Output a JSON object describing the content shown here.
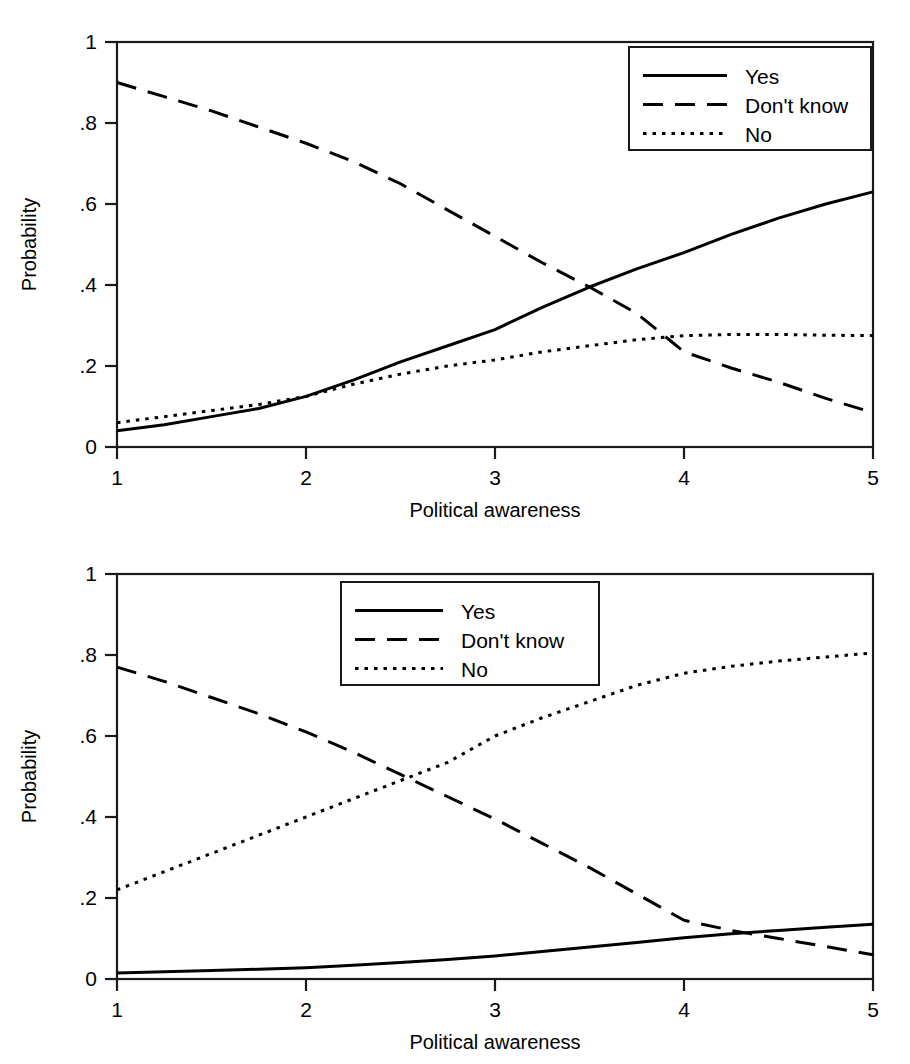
{
  "figure": {
    "background_color": "#ffffff",
    "line_color": "#000000",
    "panels": [
      "top",
      "bottom"
    ]
  },
  "panel_top": {
    "name": "top-panel",
    "xlabel": "Political awareness",
    "ylabel": "Probability",
    "xticks": [
      "1",
      "2",
      "3",
      "4",
      "5"
    ],
    "yticks": [
      "0",
      ".2",
      ".4",
      ".6",
      ".8",
      "1"
    ],
    "legend": {
      "position": "top-right",
      "items": [
        {
          "label": "Yes",
          "style": "solid"
        },
        {
          "label": "Don't know",
          "style": "dashed"
        },
        {
          "label": "No",
          "style": "dotted"
        }
      ]
    }
  },
  "panel_bottom": {
    "name": "bottom-panel",
    "xlabel": "Political awareness",
    "ylabel": "Probability",
    "xticks": [
      "1",
      "2",
      "3",
      "4",
      "5"
    ],
    "yticks": [
      "0",
      ".2",
      ".4",
      ".6",
      ".8",
      "1"
    ],
    "legend": {
      "position": "top-center",
      "items": [
        {
          "label": "Yes",
          "style": "solid"
        },
        {
          "label": "Don't know",
          "style": "dashed"
        },
        {
          "label": "No",
          "style": "dotted"
        }
      ]
    }
  },
  "chart_data": [
    {
      "type": "line",
      "panel": "top",
      "title": "",
      "xlabel": "Political awareness",
      "ylabel": "Probability",
      "xlim": [
        1,
        5
      ],
      "ylim": [
        0,
        1
      ],
      "xticks": [
        1,
        2,
        3,
        4,
        5
      ],
      "yticks": [
        0,
        0.2,
        0.4,
        0.6,
        0.8,
        1
      ],
      "grid": false,
      "legend_position": "upper right",
      "x": [
        1,
        1.25,
        1.5,
        1.75,
        2,
        2.25,
        2.5,
        2.75,
        3,
        3.25,
        3.5,
        3.75,
        4,
        4.25,
        4.5,
        4.75,
        5
      ],
      "series": [
        {
          "name": "Yes",
          "style": "solid",
          "values": [
            0.04,
            0.055,
            0.075,
            0.095,
            0.125,
            0.165,
            0.21,
            0.25,
            0.29,
            0.345,
            0.395,
            0.44,
            0.48,
            0.525,
            0.565,
            0.6,
            0.63
          ]
        },
        {
          "name": "Don't know",
          "style": "dashed",
          "values": [
            0.9,
            0.865,
            0.83,
            0.79,
            0.75,
            0.705,
            0.65,
            0.585,
            0.52,
            0.455,
            0.395,
            0.33,
            0.235,
            0.195,
            0.16,
            0.12,
            0.085
          ]
        },
        {
          "name": "No",
          "style": "dotted",
          "values": [
            0.06,
            0.075,
            0.09,
            0.105,
            0.125,
            0.155,
            0.18,
            0.2,
            0.215,
            0.235,
            0.25,
            0.265,
            0.275,
            0.278,
            0.278,
            0.276,
            0.275
          ]
        }
      ]
    },
    {
      "type": "line",
      "panel": "bottom",
      "title": "",
      "xlabel": "Political awareness",
      "ylabel": "Probability",
      "xlim": [
        1,
        5
      ],
      "ylim": [
        0,
        1
      ],
      "xticks": [
        1,
        2,
        3,
        4,
        5
      ],
      "yticks": [
        0,
        0.2,
        0.4,
        0.6,
        0.8,
        1
      ],
      "grid": false,
      "legend_position": "upper center",
      "x": [
        1,
        1.25,
        1.5,
        1.75,
        2,
        2.25,
        2.5,
        2.75,
        3,
        3.25,
        3.5,
        3.75,
        4,
        4.25,
        4.5,
        4.75,
        5
      ],
      "series": [
        {
          "name": "Yes",
          "style": "solid",
          "values": [
            0.015,
            0.018,
            0.021,
            0.024,
            0.028,
            0.034,
            0.041,
            0.048,
            0.057,
            0.068,
            0.079,
            0.09,
            0.102,
            0.112,
            0.12,
            0.128,
            0.135
          ]
        },
        {
          "name": "Don't know",
          "style": "dashed",
          "values": [
            0.77,
            0.735,
            0.695,
            0.655,
            0.61,
            0.56,
            0.505,
            0.45,
            0.395,
            0.335,
            0.275,
            0.21,
            0.145,
            0.12,
            0.1,
            0.08,
            0.06
          ]
        },
        {
          "name": "No",
          "style": "dotted",
          "values": [
            0.22,
            0.265,
            0.31,
            0.355,
            0.4,
            0.445,
            0.49,
            0.535,
            0.6,
            0.645,
            0.685,
            0.725,
            0.755,
            0.772,
            0.785,
            0.795,
            0.805
          ]
        }
      ]
    }
  ]
}
